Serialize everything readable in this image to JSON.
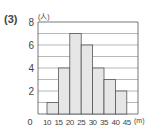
{
  "problem_label": "(3)",
  "chart_data": {
    "type": "bar",
    "title": "",
    "xlabel": "(m)",
    "ylabel": "(人)",
    "bin_edges": [
      10,
      15,
      20,
      25,
      30,
      35,
      40,
      45
    ],
    "categories": [
      "10-15",
      "15-20",
      "20-25",
      "25-30",
      "30-35",
      "35-40",
      "40-45"
    ],
    "values": [
      1,
      4,
      7,
      6,
      4,
      3,
      2
    ],
    "ylim": [
      0,
      8
    ],
    "yticks": [
      "0",
      "2",
      "4",
      "6",
      "8"
    ],
    "xticks": [
      "10",
      "15",
      "20",
      "25",
      "30",
      "35",
      "40",
      "45"
    ],
    "grid": true,
    "bar_color": "#e6e6e6",
    "edge_color": "#555555"
  }
}
